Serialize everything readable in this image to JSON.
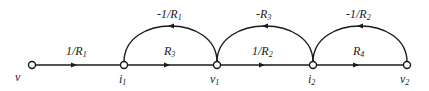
{
  "diagram": {
    "type": "signal-flow-graph",
    "nodes": [
      {
        "id": "v",
        "label": "v",
        "x": 32,
        "y": 65
      },
      {
        "id": "i1",
        "label": "i1",
        "x": 124,
        "y": 65
      },
      {
        "id": "v1",
        "label": "v1",
        "x": 217,
        "y": 65
      },
      {
        "id": "i2",
        "label": "i2",
        "x": 313,
        "y": 65
      },
      {
        "id": "v2",
        "label": "v2",
        "x": 407,
        "y": 65
      }
    ],
    "forward_edges": [
      {
        "from": "v",
        "to": "i1",
        "gain": "1/R1"
      },
      {
        "from": "i1",
        "to": "v1",
        "gain": "R3"
      },
      {
        "from": "v1",
        "to": "i2",
        "gain": "1/R2"
      },
      {
        "from": "i2",
        "to": "v2",
        "gain": "R4"
      }
    ],
    "feedback_edges": [
      {
        "from": "v1",
        "to": "i1",
        "gain": "-1/R1"
      },
      {
        "from": "i2",
        "to": "v1",
        "gain": "-R3"
      },
      {
        "from": "v2",
        "to": "i2",
        "gain": "-1/R2"
      }
    ]
  }
}
